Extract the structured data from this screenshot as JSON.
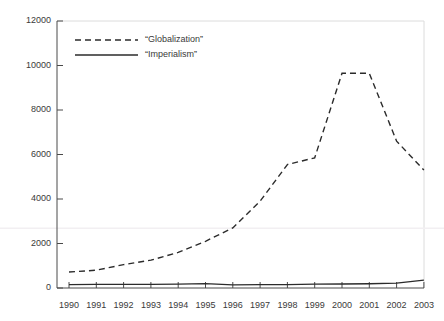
{
  "chart_data": {
    "type": "line",
    "title": "",
    "subtitle": "",
    "xlabel": "",
    "ylabel": "",
    "categories": [
      "1990",
      "1991",
      "1992",
      "1993",
      "1994",
      "1995",
      "1996",
      "1997",
      "1998",
      "1999",
      "2000",
      "2001",
      "2002",
      "2003"
    ],
    "x": [
      1990,
      1991,
      1992,
      1993,
      1994,
      1995,
      1996,
      1997,
      1998,
      1999,
      2000,
      2001,
      2002,
      2003
    ],
    "xlim": [
      1990,
      2003
    ],
    "ylim": [
      0,
      12000
    ],
    "yticks": [
      0,
      2000,
      4000,
      6000,
      8000,
      10000,
      12000
    ],
    "ytick_labels": [
      "0",
      "2000",
      "4000",
      "6000",
      "8000",
      "10000",
      "12000"
    ],
    "xticks": [
      1990,
      1991,
      1992,
      1993,
      1994,
      1995,
      1996,
      1997,
      1998,
      1999,
      2000,
      2001,
      2002,
      2003
    ],
    "xtick_labels": [
      "1990",
      "1991",
      "1992",
      "1993",
      "1994",
      "1995",
      "1996",
      "1997",
      "1998",
      "1999",
      "2000",
      "2001",
      "2002",
      "2003"
    ],
    "grid": false,
    "legend_position": "upper-left",
    "series": [
      {
        "name": "“Globalization”",
        "style": "dashed",
        "color": "#2b2b2b",
        "values": [
          720,
          800,
          1050,
          1250,
          1600,
          2100,
          2700,
          3900,
          5550,
          5850,
          9650,
          9650,
          6600,
          5300
        ]
      },
      {
        "name": "“Imperialism”",
        "style": "solid",
        "color": "#2b2b2b",
        "values": [
          150,
          160,
          165,
          160,
          170,
          200,
          140,
          150,
          150,
          170,
          180,
          190,
          220,
          350
        ]
      }
    ]
  },
  "legend": {
    "items": [
      {
        "label": "“Globalization”",
        "style": "dashed"
      },
      {
        "label": "“Imperialism”",
        "style": "solid"
      }
    ]
  },
  "axes": {
    "y_labels": [
      "12000",
      "10000",
      "8000",
      "6000",
      "4000",
      "2000",
      "0"
    ],
    "x_labels": [
      "1990",
      "1991",
      "1992",
      "1993",
      "1994",
      "1995",
      "1996",
      "1997",
      "1998",
      "1999",
      "2000",
      "2001",
      "2002",
      "2003"
    ]
  },
  "colors": {
    "line": "#2b2b2b",
    "axis": "#4a4a4a",
    "frame": "#d8d8d8",
    "faint_rule": "#f0eef0",
    "text": "#3a3a3a",
    "background": "#ffffff"
  }
}
